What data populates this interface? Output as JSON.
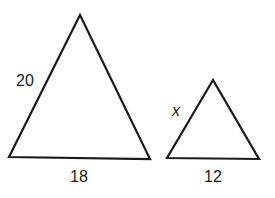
{
  "diagram": {
    "type": "similar-triangles",
    "large_triangle": {
      "side_label": "20",
      "base_label": "18"
    },
    "small_triangle": {
      "side_label": "x",
      "base_label": "12"
    },
    "stroke_color": "#1a1a1a"
  }
}
